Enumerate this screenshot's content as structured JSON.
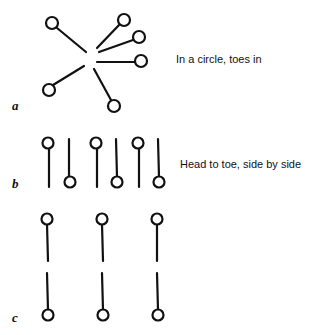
{
  "panels": [
    {
      "label": "a",
      "caption": "In a circle, toes in"
    },
    {
      "label": "b",
      "caption": "Head to toe, side by side"
    },
    {
      "label": "c",
      "caption": ""
    }
  ]
}
